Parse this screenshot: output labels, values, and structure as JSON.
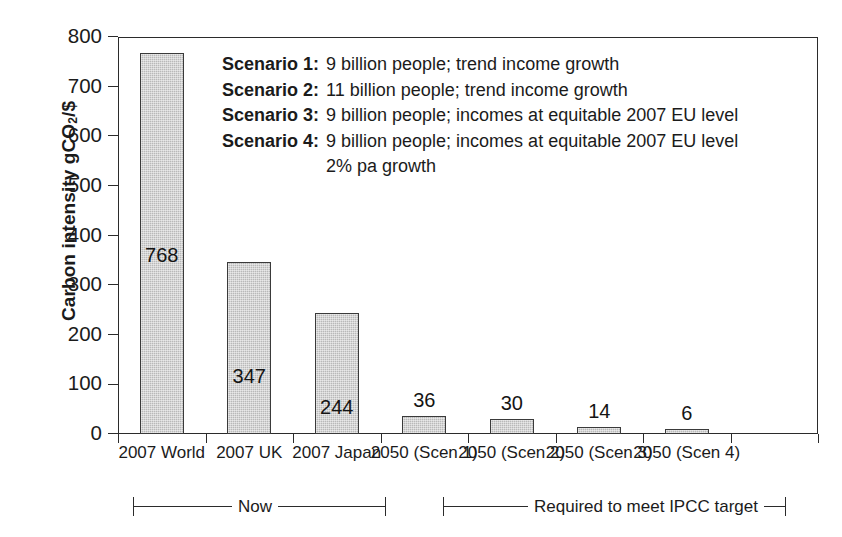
{
  "chart_data": {
    "type": "bar",
    "title": "",
    "xlabel": "",
    "ylabel": "Carbon intensity gCO2/$",
    "ylabel_rich": {
      "prefix": "Carbon intensity gCO",
      "sub": "2",
      "suffix": "/$"
    },
    "categories": [
      "2007 World",
      "2007 UK",
      "2007 Japan",
      "2050 (Scen 1)",
      "2050 (Scen 2)",
      "2050 (Scen 3)",
      "2050 (Scen 4)"
    ],
    "values": [
      768,
      347,
      244,
      36,
      30,
      14,
      6
    ],
    "value_labels": [
      "768",
      "347",
      "244",
      "36",
      "30",
      "14",
      "6"
    ],
    "ylim": [
      0,
      800
    ],
    "yticks": [
      0,
      100,
      200,
      300,
      400,
      500,
      600,
      700,
      800
    ],
    "ytick_labels": [
      "0",
      "100",
      "200",
      "300",
      "400",
      "500",
      "600",
      "700",
      "800"
    ],
    "grid": false,
    "legend_position": "inside-upper-right",
    "bar_fill_color": "#b9b9b9",
    "bar_border_color": "#3a3a3a",
    "axis_color": "#2b2b2b",
    "text_color": "#1b1b1b"
  },
  "legend": {
    "rows": [
      {
        "key": "Scenario 1:",
        "text": "9 billion people; trend income growth"
      },
      {
        "key": "Scenario 2:",
        "text": "11 billion people; trend income growth"
      },
      {
        "key": "Scenario 3:",
        "text": "9 billion people; incomes at equitable 2007 EU level"
      },
      {
        "key": "Scenario 4:",
        "text": "9 billion people; incomes at equitable 2007 EU level"
      }
    ],
    "continuation": "2% pa growth"
  },
  "brackets": [
    {
      "label": "Now"
    },
    {
      "label": "Required to meet IPCC target"
    }
  ]
}
